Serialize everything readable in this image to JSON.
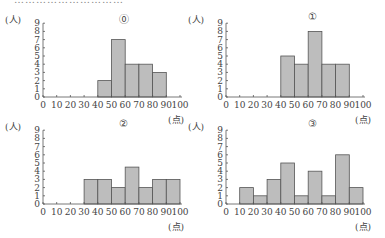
{
  "top_text": "…………………………",
  "chart_data": [
    {
      "type": "bar",
      "title": "⓪",
      "xlabel": "(点)",
      "ylabel": "(人)",
      "bins": [
        0,
        10,
        20,
        30,
        40,
        50,
        60,
        70,
        80,
        90,
        100
      ],
      "categories": [
        "0-10",
        "10-20",
        "20-30",
        "30-40",
        "40-50",
        "50-60",
        "60-70",
        "70-80",
        "80-90",
        "90-100"
      ],
      "values": [
        0,
        0,
        0,
        0,
        2,
        7,
        4,
        4,
        3,
        0
      ],
      "ylim": [
        0,
        9
      ],
      "xlim": [
        0,
        100
      ],
      "yticks": [
        0,
        1,
        2,
        3,
        4,
        5,
        6,
        7,
        8,
        9
      ],
      "xticks": [
        0,
        10,
        20,
        30,
        40,
        50,
        60,
        70,
        80,
        90,
        100
      ],
      "grid": false
    },
    {
      "type": "bar",
      "title": "①",
      "xlabel": "(点)",
      "ylabel": "(人)",
      "bins": [
        0,
        10,
        20,
        30,
        40,
        50,
        60,
        70,
        80,
        90,
        100
      ],
      "categories": [
        "0-10",
        "10-20",
        "20-30",
        "30-40",
        "40-50",
        "50-60",
        "60-70",
        "70-80",
        "80-90",
        "90-100"
      ],
      "values": [
        0,
        0,
        0,
        0,
        5,
        4,
        8,
        4,
        4,
        0
      ],
      "ylim": [
        0,
        9
      ],
      "xlim": [
        0,
        100
      ],
      "yticks": [
        0,
        1,
        2,
        3,
        4,
        5,
        6,
        7,
        8,
        9
      ],
      "xticks": [
        0,
        10,
        20,
        30,
        40,
        50,
        60,
        70,
        80,
        90,
        100
      ],
      "grid": false
    },
    {
      "type": "bar",
      "title": "②",
      "xlabel": "(点)",
      "ylabel": "(人)",
      "bins": [
        0,
        10,
        20,
        30,
        40,
        50,
        60,
        70,
        80,
        90,
        100
      ],
      "categories": [
        "0-10",
        "10-20",
        "20-30",
        "30-40",
        "40-50",
        "50-60",
        "60-70",
        "70-80",
        "80-90",
        "90-100"
      ],
      "values": [
        0,
        0,
        0,
        3,
        3,
        2,
        4.5,
        2,
        3,
        3
      ],
      "ylim": [
        0,
        9
      ],
      "xlim": [
        0,
        100
      ],
      "yticks": [
        0,
        1,
        2,
        3,
        4,
        5,
        6,
        7,
        8,
        9
      ],
      "xticks": [
        0,
        10,
        20,
        30,
        40,
        50,
        60,
        70,
        80,
        90,
        100
      ],
      "grid": false
    },
    {
      "type": "bar",
      "title": "③",
      "xlabel": "(点)",
      "ylabel": "(人)",
      "bins": [
        0,
        10,
        20,
        30,
        40,
        50,
        60,
        70,
        80,
        90,
        100
      ],
      "categories": [
        "0-10",
        "10-20",
        "20-30",
        "30-40",
        "40-50",
        "50-60",
        "60-70",
        "70-80",
        "80-90",
        "90-100"
      ],
      "values": [
        0,
        2,
        1,
        3,
        5,
        1,
        4,
        1,
        6,
        2
      ],
      "ylim": [
        0,
        9
      ],
      "xlim": [
        0,
        100
      ],
      "yticks": [
        0,
        1,
        2,
        3,
        4,
        5,
        6,
        7,
        8,
        9
      ],
      "xticks": [
        0,
        10,
        20,
        30,
        40,
        50,
        60,
        70,
        80,
        90,
        100
      ],
      "grid": false
    }
  ],
  "style": {
    "bar_fill": "#bdbdbd",
    "bar_stroke": "#555555",
    "axis": "#555555",
    "text": "#444444"
  }
}
